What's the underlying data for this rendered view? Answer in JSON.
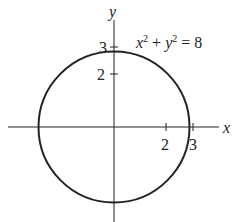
{
  "diagram": {
    "equation": {
      "x": "x",
      "x_exp": "2",
      "plus": " + ",
      "y": "y",
      "y_exp": "2",
      "rhs": " = 8"
    },
    "axes": {
      "x_label": "x",
      "y_label": "y"
    },
    "x_ticks": [
      {
        "value": 2,
        "label": "2"
      },
      {
        "value": 3,
        "label": "3"
      }
    ],
    "y_ticks": [
      {
        "value": 2,
        "label": "2"
      },
      {
        "value": 3,
        "label": "3"
      }
    ],
    "circle": {
      "center": [
        0,
        0
      ],
      "radius_squared": 8
    },
    "colors": {
      "stroke": "#222222",
      "background": "#ffffff"
    }
  }
}
